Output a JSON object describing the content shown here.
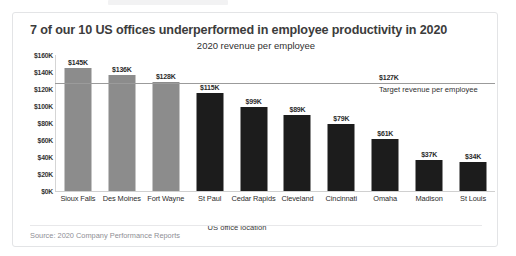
{
  "card": {
    "title": "7 of our 10 US offices underperformed in employee productivity in 2020",
    "source_note": "Source: 2020 Company Performance Reports"
  },
  "chart_data": {
    "type": "bar",
    "title": "2020 revenue per employee",
    "xlabel": "US office location",
    "ylabel": "",
    "ylim": [
      0,
      160000
    ],
    "grid": false,
    "legend": "none",
    "categories": [
      "Sioux Falls",
      "Des Moines",
      "Fort Wayne",
      "St Paul",
      "Cedar Rapids",
      "Cleveland",
      "Cincinnati",
      "Omaha",
      "Madison",
      "St Louis"
    ],
    "values": [
      145000,
      136000,
      128000,
      115000,
      99000,
      89000,
      79000,
      61000,
      37000,
      34000
    ],
    "data_labels": [
      "$145K",
      "$136K",
      "$128K",
      "$115K",
      "$99K",
      "$89K",
      "$79K",
      "$61K",
      "$37K",
      "$34K"
    ],
    "bar_colors": [
      "#8c8c8c",
      "#8c8c8c",
      "#8c8c8c",
      "#1c1c1c",
      "#1c1c1c",
      "#1c1c1c",
      "#1c1c1c",
      "#1c1c1c",
      "#1c1c1c",
      "#1c1c1c"
    ],
    "ytick_labels": [
      "$160K",
      "$140K",
      "$120K",
      "$100K",
      "$80K",
      "$60K",
      "$40K",
      "$20K",
      "$0K"
    ],
    "ytick_values": [
      160000,
      140000,
      120000,
      100000,
      80000,
      60000,
      40000,
      20000,
      0
    ],
    "reference_line": {
      "value": 127000,
      "value_label": "$127K",
      "caption": "Target revenue per employee",
      "color": "#9b9b9b"
    }
  }
}
